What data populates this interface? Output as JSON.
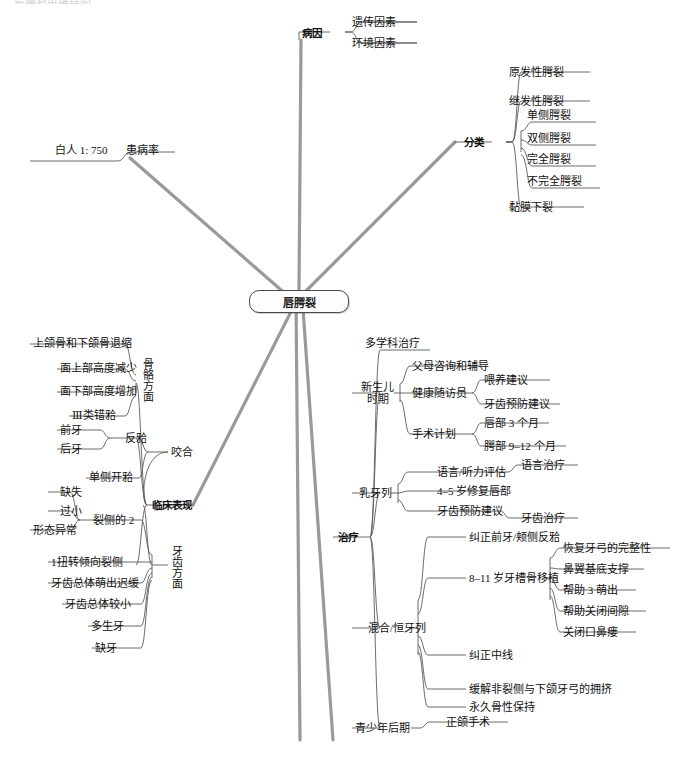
{
  "document": {
    "title": "唇腭裂",
    "top_cropped_text": "唇腭裂思维导图",
    "center_node": "唇腭裂"
  },
  "colors": {
    "main_branch_line": "#9a9a9a",
    "sub_branch_line": "#555555",
    "text": "#111111",
    "node_border": "#4a4a4a",
    "background": "#ffffff"
  },
  "branches": {
    "prevalence": {
      "label": "患病率",
      "children": [
        {
          "label": "白人 1: 750"
        }
      ]
    },
    "etiology": {
      "label": "病因",
      "children": [
        {
          "label": "遗传因素"
        },
        {
          "label": "环境因素"
        }
      ]
    },
    "classification": {
      "label": "分类",
      "children": [
        {
          "label": "原发性腭裂"
        },
        {
          "label": "继发性腭裂"
        },
        {
          "label": "单侧腭裂"
        },
        {
          "label": "双侧腭裂"
        },
        {
          "label": "完全腭裂"
        },
        {
          "label": "不完全腭裂"
        },
        {
          "label": "黏膜下裂"
        }
      ]
    },
    "clinical": {
      "label": "临床表现",
      "groups": [
        {
          "label": "骨骼方面",
          "children": [
            {
              "label": "上颌骨和下颌骨退缩"
            },
            {
              "label": "面上部高度减少"
            },
            {
              "label": "面下部高度增加"
            },
            {
              "label": "Ⅲ类错𬌗"
            }
          ]
        },
        {
          "label": "咬合",
          "children": [
            {
              "label": "反𬌗",
              "children": [
                {
                  "label": "前牙"
                },
                {
                  "label": "后牙"
                }
              ]
            },
            {
              "label": "单侧开𬌗"
            }
          ]
        },
        {
          "label": "牙齿方面",
          "children": [
            {
              "label": "裂侧的 2",
              "children": [
                {
                  "label": "缺失"
                },
                {
                  "label": "过小"
                },
                {
                  "label": "形态异常"
                }
              ]
            },
            {
              "label": "1扭转倾向裂侧"
            },
            {
              "label": "牙齿总体萌出迟缓"
            },
            {
              "label": "牙齿总体较小"
            },
            {
              "label": "多生牙"
            },
            {
              "label": "缺牙"
            }
          ]
        }
      ]
    },
    "treatment": {
      "label": "治疗",
      "groups": [
        {
          "label": "多学科治疗",
          "children": []
        },
        {
          "label": "新生儿\n时期",
          "label_line1": "新生儿",
          "label_line2": "时期",
          "children": [
            {
              "label": "父母咨询和辅导"
            },
            {
              "label": "健康随访员",
              "children": [
                {
                  "label": "喂养建议"
                },
                {
                  "label": "牙齿预防建议"
                }
              ]
            },
            {
              "label": "手术计划",
              "children": [
                {
                  "label": "唇部 3 个月"
                },
                {
                  "label": "腭部 9–12 个月"
                }
              ]
            }
          ]
        },
        {
          "label": "乳牙列",
          "children": [
            {
              "label": "语言/听力评估",
              "children": [
                {
                  "label": "语言治疗"
                }
              ]
            },
            {
              "label": "4–5 岁修复唇部"
            },
            {
              "label": "牙齿预防建议",
              "children": [
                {
                  "label": "牙齿治疗"
                }
              ]
            }
          ]
        },
        {
          "label": "混合/恒牙列",
          "children": [
            {
              "label": "纠正前牙/颊侧反𬌗"
            },
            {
              "label": "8–11 岁牙槽骨移植",
              "children": [
                {
                  "label": "恢复牙弓的完整性"
                },
                {
                  "label": "鼻翼基底支撑"
                },
                {
                  "label": "帮助 3 萌出"
                },
                {
                  "label": "帮助关闭间隙"
                },
                {
                  "label": "关闭口鼻瘘"
                }
              ]
            },
            {
              "label": "纠正中线"
            },
            {
              "label": "缓解非裂侧与下颌牙弓的拥挤"
            },
            {
              "label": "永久骨性保持"
            }
          ]
        },
        {
          "label": "青少年后期",
          "children": [
            {
              "label": "正颌手术"
            }
          ]
        }
      ]
    }
  }
}
